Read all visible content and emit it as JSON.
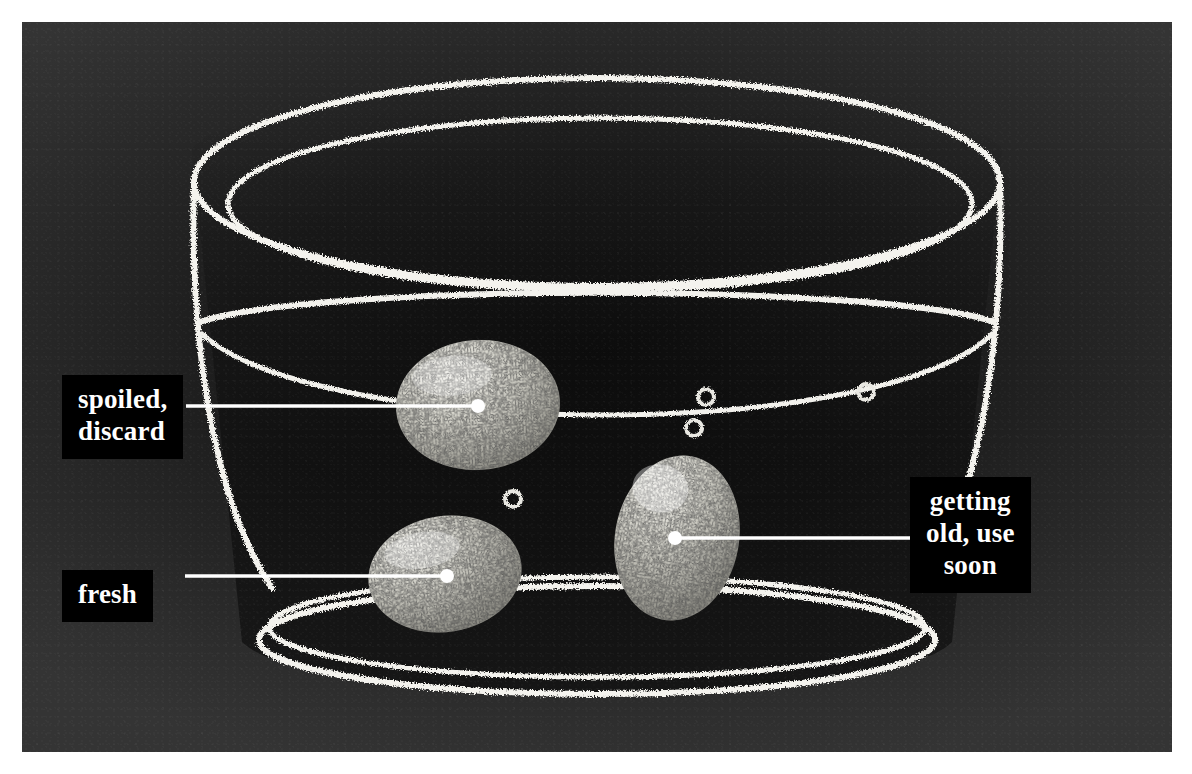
{
  "scene": {
    "title": "Egg float freshness test",
    "medium": "chalk illustration on dark board",
    "background_color": "#262626",
    "chalk_color": "#f2f2ee",
    "label_background": "#000000",
    "label_text_color": "#ffffff",
    "leader_line_color": "#ffffff",
    "mat_color": "#ffffff"
  },
  "callouts": [
    {
      "id": "spoiled",
      "text": "spoiled,\ndiscard",
      "lines": [
        "spoiled,",
        "discard"
      ],
      "align": "left",
      "target": "top-egg",
      "leader": {
        "x1": 186,
        "y1": 406,
        "x2": 478,
        "y2": 406
      },
      "dot": {
        "x": 478,
        "y": 406
      }
    },
    {
      "id": "fresh",
      "text": "fresh",
      "lines": [
        "fresh"
      ],
      "align": "left",
      "target": "bottom-left-egg",
      "leader": {
        "x1": 185,
        "y1": 576,
        "x2": 447,
        "y2": 576
      },
      "dot": {
        "x": 447,
        "y": 576
      }
    },
    {
      "id": "getting-old",
      "text": "getting\nold, use\nsoon",
      "lines": [
        "getting",
        "old, use",
        "soon"
      ],
      "align": "center",
      "target": "right-egg",
      "leader": {
        "x1": 675,
        "y1": 538,
        "x2": 935,
        "y2": 538
      },
      "dot": {
        "x": 675,
        "y": 538
      }
    }
  ],
  "eggs": [
    {
      "id": "top-egg",
      "state": "spoiled, discard",
      "position": "floating at the surface, touching the water line",
      "orientation": "horizontal",
      "center": {
        "x": 478,
        "y": 405
      },
      "radius": {
        "rx": 82,
        "ry": 65
      },
      "rotation_deg": -4
    },
    {
      "id": "bottom-left-egg",
      "state": "fresh",
      "position": "resting flat on the bottom of the bowl",
      "orientation": "horizontal",
      "center": {
        "x": 445,
        "y": 574
      },
      "radius": {
        "rx": 77,
        "ry": 58
      },
      "rotation_deg": -8
    },
    {
      "id": "right-egg",
      "state": "getting old, use soon",
      "position": "standing on end, suspended mid-water",
      "orientation": "upright",
      "center": {
        "x": 677,
        "y": 538
      },
      "radius": {
        "rx": 62,
        "ry": 83
      },
      "rotation_deg": 10
    }
  ],
  "bowl": {
    "id": "glass-bowl",
    "rim_lines": 2,
    "water_line_lines": 2,
    "base_lines": 2,
    "description": "wide glass bowl drawn in chalk with a double rim, a water line and a double foot ring"
  },
  "bubbles": [
    {
      "x": 706,
      "y": 397,
      "r": 8
    },
    {
      "x": 694,
      "y": 428,
      "r": 8
    },
    {
      "x": 866,
      "y": 392,
      "r": 8
    },
    {
      "x": 513,
      "y": 499,
      "r": 8
    }
  ]
}
